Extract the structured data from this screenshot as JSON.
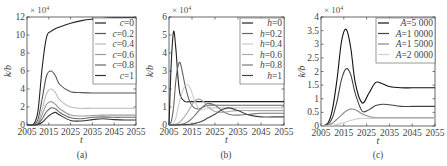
{
  "chart_data": [
    {
      "type": "line",
      "panel": "(a)",
      "xlabel": "t",
      "ylabel": "k/b",
      "y_multiplier": "× 10^4",
      "xlim": [
        2005,
        2055
      ],
      "ylim": [
        0,
        12
      ],
      "xticks": [
        "2005",
        "2015",
        "2025",
        "2035",
        "2045",
        "2055"
      ],
      "yticks": [
        "0",
        "2",
        "4",
        "6",
        "8",
        "10",
        "12"
      ],
      "legend_position": "upper right",
      "x": [
        2005,
        2008,
        2010,
        2012,
        2014,
        2016,
        2018,
        2020,
        2025,
        2030,
        2035,
        2040,
        2045,
        2050,
        2055
      ],
      "series": [
        {
          "name": "c=0",
          "color": "#222222",
          "values": [
            0,
            0.1,
            1.5,
            6.5,
            9.8,
            10.4,
            10.7,
            10.9,
            11.3,
            11.6,
            11.75,
            11.85,
            11.9,
            11.9,
            11.9
          ]
        },
        {
          "name": "c=0.2",
          "color": "#555555",
          "values": [
            0,
            0.05,
            0.6,
            3.0,
            5.5,
            6.0,
            5.5,
            4.5,
            3.7,
            3.6,
            3.55,
            3.55,
            3.55,
            3.55,
            3.55
          ]
        },
        {
          "name": "c=0.4",
          "color": "#bbbbbb",
          "values": [
            0,
            0.03,
            0.3,
            1.8,
            3.5,
            4.0,
            3.6,
            2.8,
            2.0,
            1.85,
            1.85,
            1.85,
            1.85,
            1.85,
            1.85
          ]
        },
        {
          "name": "c=0.6",
          "color": "#999999",
          "values": [
            0,
            0.02,
            0.2,
            1.2,
            2.3,
            2.6,
            2.3,
            1.8,
            1.1,
            1.0,
            1.05,
            1.1,
            1.1,
            1.1,
            1.1
          ]
        },
        {
          "name": "c=0.8",
          "color": "#666666",
          "values": [
            0,
            0.01,
            0.1,
            0.7,
            1.5,
            1.9,
            1.8,
            1.4,
            0.8,
            0.7,
            0.85,
            0.9,
            0.85,
            0.85,
            0.85
          ]
        },
        {
          "name": "c=1",
          "color": "#333333",
          "values": [
            0,
            0.0,
            0.05,
            0.3,
            0.8,
            1.2,
            1.4,
            1.1,
            0.5,
            0.45,
            0.6,
            0.7,
            0.6,
            0.55,
            0.55
          ]
        }
      ]
    },
    {
      "type": "line",
      "panel": "(b)",
      "xlabel": "t",
      "ylabel": "k/b",
      "y_multiplier": "× 10^4",
      "xlim": [
        2005,
        2055
      ],
      "ylim": [
        0,
        6
      ],
      "xticks": [
        "2005",
        "2015",
        "2025",
        "2035",
        "2045",
        "2055"
      ],
      "yticks": [
        "0",
        "1",
        "2",
        "3",
        "4",
        "5",
        "6"
      ],
      "legend_position": "upper right",
      "x": [
        2005,
        2006,
        2007,
        2008,
        2009,
        2010,
        2012,
        2014,
        2016,
        2018,
        2020,
        2022,
        2025,
        2028,
        2031,
        2035,
        2040,
        2045,
        2050,
        2055
      ],
      "series": [
        {
          "name": "h=0",
          "color": "#222222",
          "values": [
            0,
            3.5,
            5.2,
            4.2,
            2.5,
            1.6,
            1.3,
            1.3,
            1.3,
            1.3,
            1.3,
            1.3,
            1.3,
            1.3,
            1.3,
            1.3,
            1.3,
            1.3,
            1.3,
            1.3
          ]
        },
        {
          "name": "h=0.2",
          "color": "#666666",
          "values": [
            0,
            0.2,
            1.0,
            2.5,
            3.3,
            3.4,
            2.2,
            1.3,
            0.95,
            0.9,
            1.0,
            1.1,
            1.1,
            1.1,
            1.1,
            1.1,
            1.1,
            1.1,
            1.1,
            1.1
          ]
        },
        {
          "name": "h=0.4",
          "color": "#cccccc",
          "values": [
            0,
            0.02,
            0.1,
            0.4,
            1.0,
            1.5,
            2.2,
            2.1,
            1.4,
            0.9,
            0.85,
            0.95,
            0.95,
            0.95,
            0.95,
            0.95,
            0.95,
            0.95,
            0.95,
            0.95
          ]
        },
        {
          "name": "h=0.6",
          "color": "#aaaaaa",
          "values": [
            0,
            0,
            0.02,
            0.05,
            0.1,
            0.2,
            0.5,
            0.9,
            1.3,
            1.45,
            1.3,
            1.0,
            0.75,
            0.7,
            0.75,
            0.8,
            0.8,
            0.8,
            0.8,
            0.8
          ]
        },
        {
          "name": "h=0.8",
          "color": "#777777",
          "values": [
            0,
            0,
            0,
            0.01,
            0.02,
            0.04,
            0.1,
            0.25,
            0.5,
            0.8,
            1.05,
            1.2,
            1.1,
            0.8,
            0.6,
            0.55,
            0.6,
            0.65,
            0.65,
            0.65
          ]
        },
        {
          "name": "h=1",
          "color": "#444444",
          "values": [
            0,
            0,
            0,
            0,
            0,
            0.01,
            0.02,
            0.04,
            0.08,
            0.15,
            0.25,
            0.4,
            0.6,
            0.85,
            0.95,
            0.8,
            0.55,
            0.45,
            0.45,
            0.45
          ]
        }
      ],
      "extra_series_note": "additional low curves rising slowly toward ~0.45 by 2055"
    },
    {
      "type": "line",
      "panel": "(c)",
      "xlabel": "t",
      "ylabel": "k/b",
      "y_multiplier": "× 10^4",
      "xlim": [
        2005,
        2055
      ],
      "ylim": [
        0,
        4
      ],
      "xticks": [
        "2005",
        "2015",
        "2025",
        "2035",
        "2045",
        "2055"
      ],
      "yticks": [
        "0",
        "0.5",
        "1",
        "1.5",
        "2",
        "2.5",
        "3",
        "3.5",
        "4"
      ],
      "legend_position": "upper right",
      "x": [
        2005,
        2008,
        2010,
        2012,
        2014,
        2016,
        2018,
        2020,
        2023,
        2026,
        2029,
        2032,
        2035,
        2040,
        2045,
        2050,
        2055
      ],
      "series": [
        {
          "name": "A=5 000",
          "color": "#111111",
          "values": [
            0,
            0.1,
            0.6,
            1.7,
            3.1,
            3.55,
            2.9,
            1.6,
            0.85,
            1.2,
            1.6,
            1.55,
            1.45,
            1.4,
            1.4,
            1.4,
            1.4
          ]
        },
        {
          "name": "A=1 0000",
          "color": "#444444",
          "values": [
            0,
            0.05,
            0.3,
            0.9,
            1.7,
            2.1,
            1.9,
            1.2,
            0.55,
            0.6,
            0.75,
            0.8,
            0.78,
            0.72,
            0.72,
            0.72,
            0.72
          ]
        },
        {
          "name": "A=1 5000",
          "color": "#888888",
          "values": [
            0,
            0.02,
            0.1,
            0.25,
            0.4,
            0.55,
            0.62,
            0.6,
            0.45,
            0.35,
            0.3,
            0.3,
            0.3,
            0.3,
            0.3,
            0.3,
            0.3
          ]
        },
        {
          "name": "A=2 0000",
          "color": "#cccccc",
          "values": [
            0,
            0.01,
            0.03,
            0.06,
            0.1,
            0.15,
            0.2,
            0.25,
            0.28,
            0.28,
            0.28,
            0.28,
            0.28,
            0.28,
            0.28,
            0.28,
            0.28
          ]
        }
      ]
    }
  ],
  "panels": {
    "a": {
      "caption": "(a)",
      "xlabel": "t",
      "ylabel": "k/b",
      "exp": "× 10",
      "exp_sup": "4",
      "yticks": [
        "0",
        "2",
        "4",
        "6",
        "8",
        "10",
        "12"
      ],
      "xticks": [
        "2005",
        "2015",
        "2025",
        "2035",
        "2045",
        "2055"
      ],
      "legend": [
        "c=0",
        "c=0.2",
        "c=0.4",
        "c=0.6",
        "c=0.8",
        "c=1"
      ]
    },
    "b": {
      "caption": "(b)",
      "xlabel": "t",
      "ylabel": "k/b",
      "exp": "× 10",
      "exp_sup": "4",
      "yticks": [
        "0",
        "1",
        "2",
        "3",
        "4",
        "5",
        "6"
      ],
      "xticks": [
        "2005",
        "2015",
        "2025",
        "2035",
        "2045",
        "2055"
      ],
      "legend": [
        "h=0",
        "h=0.2",
        "h=0.4",
        "h=0.6",
        "h=0.8",
        "h=1"
      ]
    },
    "c": {
      "caption": "(c)",
      "xlabel": "t",
      "ylabel": "k/b",
      "exp": "× 10",
      "exp_sup": "4",
      "yticks": [
        "0",
        "0.5",
        "1",
        "1.5",
        "2",
        "2.5",
        "3",
        "3.5",
        "4"
      ],
      "xticks": [
        "2005",
        "2015",
        "2025",
        "2035",
        "2045",
        "2055"
      ],
      "legend": [
        "A=5 000",
        "A=1 0000",
        "A=1 5000",
        "A=2 0000"
      ]
    }
  }
}
